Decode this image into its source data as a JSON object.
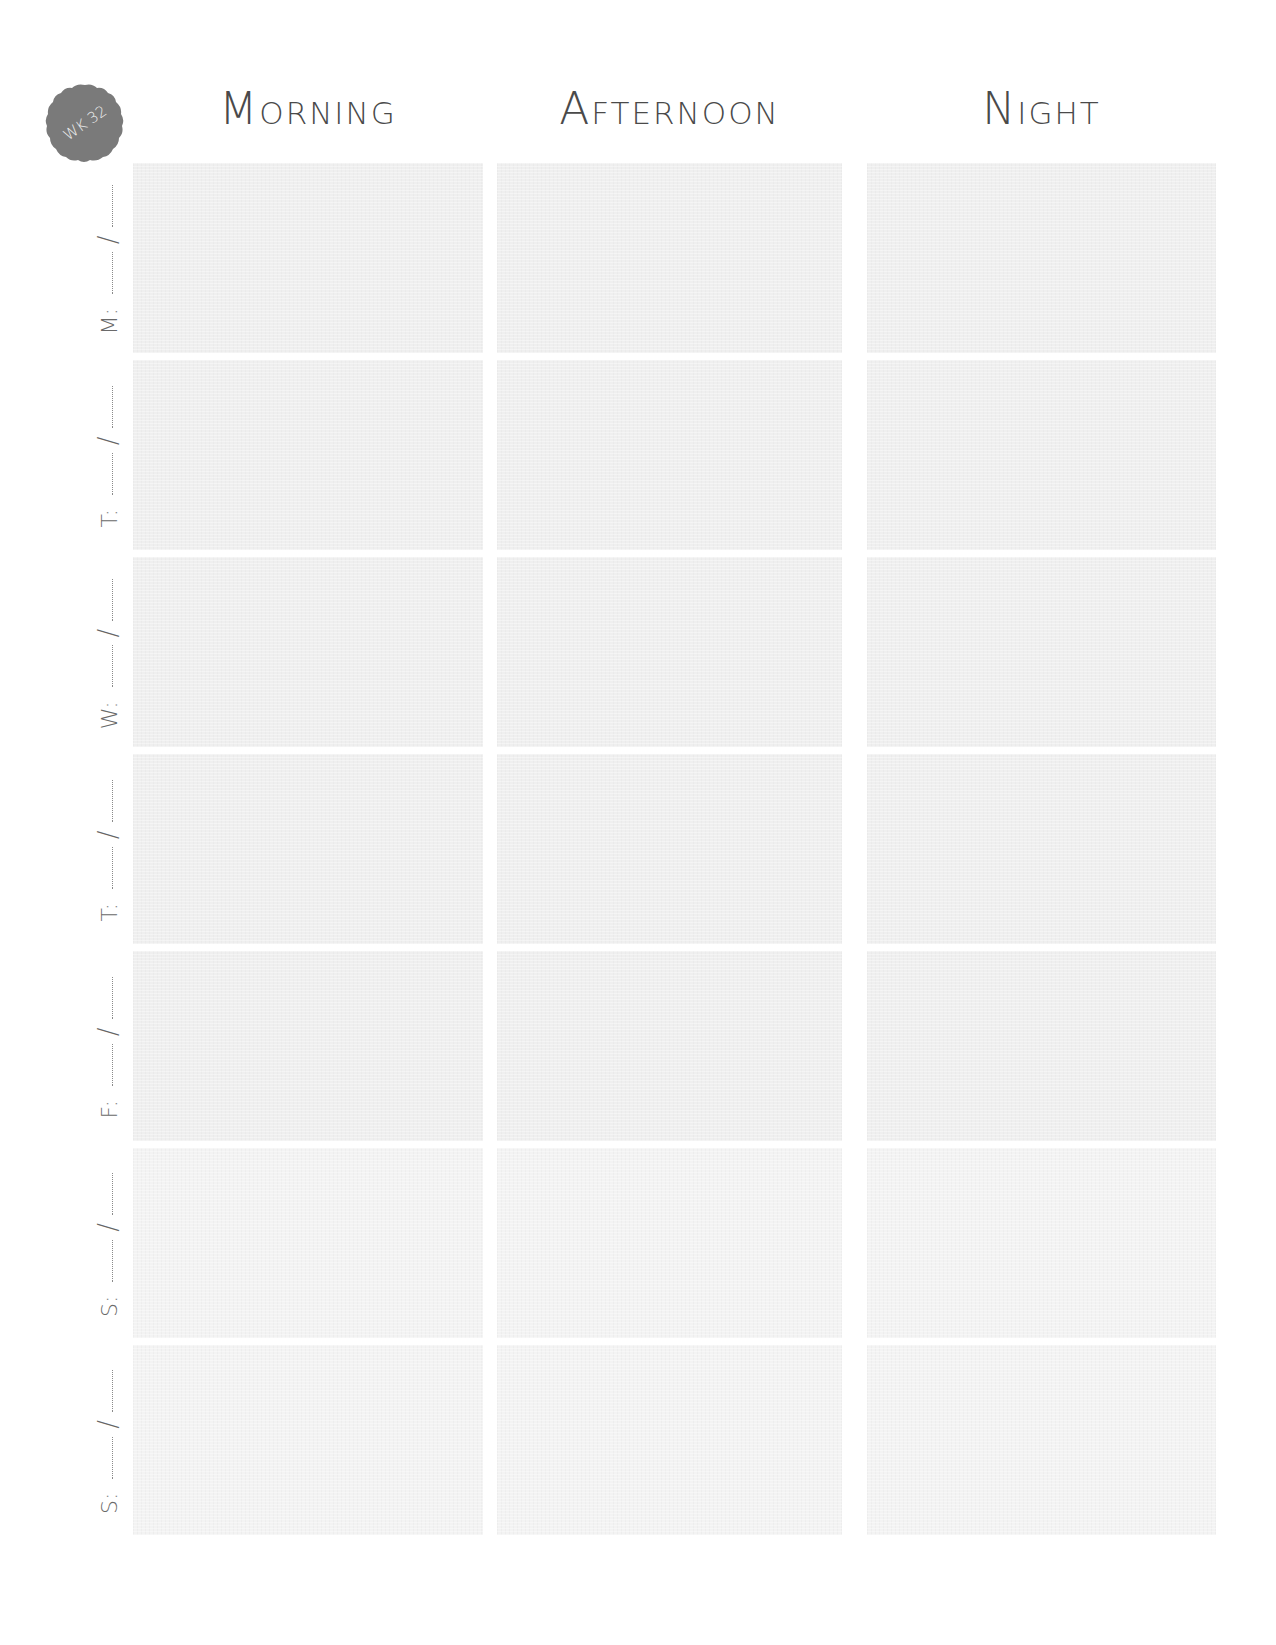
{
  "badge": {
    "label": "WK 32",
    "color": "#7a7a7a",
    "text_color": "#eeeeee",
    "icon": "scalloped-circle-badge"
  },
  "headers": {
    "morning": "Morning",
    "afternoon": "Afternoon",
    "night": "Night"
  },
  "date_separator": "/",
  "rows": [
    {
      "day": "M:"
    },
    {
      "day": "T:"
    },
    {
      "day": "W:"
    },
    {
      "day": "T:"
    },
    {
      "day": "F:"
    },
    {
      "day": "S:"
    },
    {
      "day": "S:"
    }
  ],
  "colors": {
    "text": "#4a4a4a",
    "cell_fill": "#efefef",
    "background": "#ffffff"
  }
}
